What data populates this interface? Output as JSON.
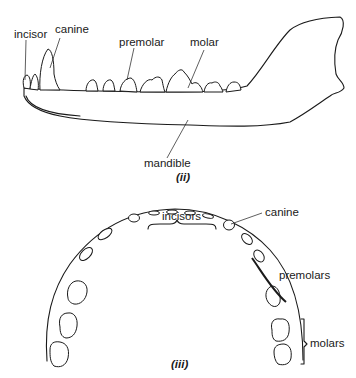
{
  "figure_ii": {
    "caption": "(ii)",
    "labels": {
      "incisor": "incisor",
      "canine": "canine",
      "premolar": "premolar",
      "molar": "molar",
      "mandible": "mandible"
    }
  },
  "figure_iii": {
    "caption": "(iii)",
    "labels": {
      "incisors": "incisors",
      "canine": "canine",
      "premolars": "premolars",
      "molars": "molars"
    }
  },
  "colors": {
    "line": "#1a1a1a",
    "background": "#ffffff"
  }
}
